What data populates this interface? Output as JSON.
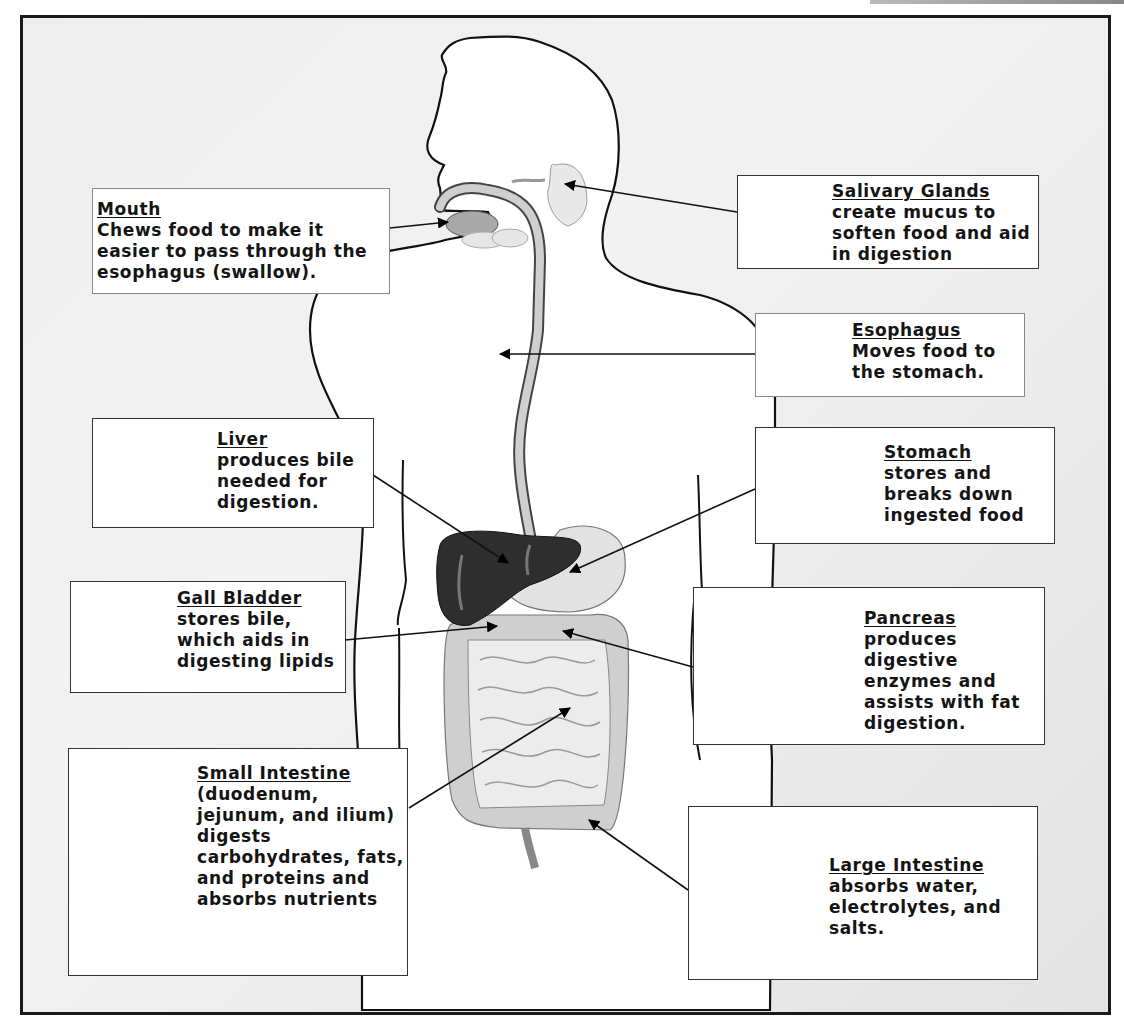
{
  "diagram": {
    "labels": [
      {
        "id": "mouth",
        "title": "Mouth",
        "body": "Chews food to make it easier to pass through the esophagus  (swallow)."
      },
      {
        "id": "salivary",
        "title": "Salivary Glands",
        "body": "create mucus to soften food and aid in digestion"
      },
      {
        "id": "esophagus",
        "title": "Esophagus",
        "body": "Moves food to the stomach."
      },
      {
        "id": "liver",
        "title": "Liver",
        "body": "produces bile needed for digestion."
      },
      {
        "id": "stomach",
        "title": "Stomach",
        "body": "stores and breaks down ingested food"
      },
      {
        "id": "gallbladder",
        "title": "Gall Bladder",
        "body": "stores bile, which aids in digesting lipids"
      },
      {
        "id": "pancreas",
        "title": "Pancreas",
        "body": "produces digestive enzymes and assists with fat digestion."
      },
      {
        "id": "small_intestine",
        "title": "Small Intestine",
        "body": "(duodenum, jejunum, and ilium) digests carbohydrates, fats, and proteins and absorbs nutrients"
      },
      {
        "id": "large_intestine",
        "title": "Large Intestine",
        "body": "absorbs water, electrolytes, and salts."
      }
    ],
    "colors": {
      "outline": "#111111",
      "liver": "#2e2e2e",
      "organ_fill": "#d9d9d9",
      "esophagus_fill": "#cfcfcf",
      "background": "#eeeeee"
    }
  }
}
